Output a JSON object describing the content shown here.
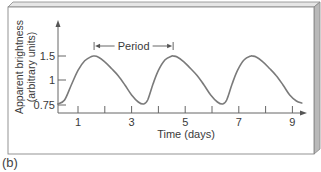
{
  "caption": "(b)",
  "chart_data": {
    "type": "line",
    "title": "",
    "xlabel": "Time (days)",
    "ylabel_lines": [
      "Apparent brightness",
      "(arbitrary units)"
    ],
    "x_ticks": [
      1,
      2,
      3,
      4,
      5,
      6,
      7,
      8,
      9
    ],
    "x_tick_labels": [
      "1",
      "3",
      "5",
      "7",
      "9"
    ],
    "x_tick_label_values": [
      1,
      3,
      5,
      7,
      9
    ],
    "y_ticks": [
      0.75,
      1,
      1.5
    ],
    "y_tick_labels": [
      "0.75",
      "1",
      "1.5"
    ],
    "xlim": [
      0.25,
      9.6
    ],
    "ylim": [
      0.72,
      1.9
    ],
    "grid": false,
    "series": [
      {
        "name": "Cepheid light curve",
        "color": "#7a7a7a",
        "x": [
          0.25,
          0.5,
          0.75,
          1.0,
          1.25,
          1.5,
          1.6,
          1.75,
          2.0,
          2.25,
          2.5,
          2.75,
          3.0,
          3.25,
          3.45,
          3.6,
          3.8,
          4.0,
          4.25,
          4.5,
          4.55,
          4.7,
          4.95,
          5.2,
          5.45,
          5.7,
          5.95,
          6.2,
          6.4,
          6.55,
          6.75,
          6.95,
          7.2,
          7.45,
          7.5,
          7.65,
          7.9,
          8.15,
          8.4,
          8.65,
          8.9,
          9.15,
          9.35
        ],
        "y": [
          0.76,
          0.8,
          0.95,
          1.2,
          1.4,
          1.49,
          1.5,
          1.48,
          1.38,
          1.24,
          1.09,
          0.95,
          0.85,
          0.78,
          0.76,
          0.8,
          0.96,
          1.2,
          1.42,
          1.5,
          1.5,
          1.48,
          1.38,
          1.24,
          1.09,
          0.95,
          0.85,
          0.78,
          0.76,
          0.8,
          0.96,
          1.2,
          1.42,
          1.5,
          1.5,
          1.48,
          1.38,
          1.24,
          1.09,
          0.95,
          0.85,
          0.79,
          0.77
        ]
      }
    ],
    "annotations": [
      {
        "type": "bracket",
        "text": "Period",
        "x_start": 1.6,
        "x_end": 4.55,
        "y": 1.7
      }
    ]
  }
}
